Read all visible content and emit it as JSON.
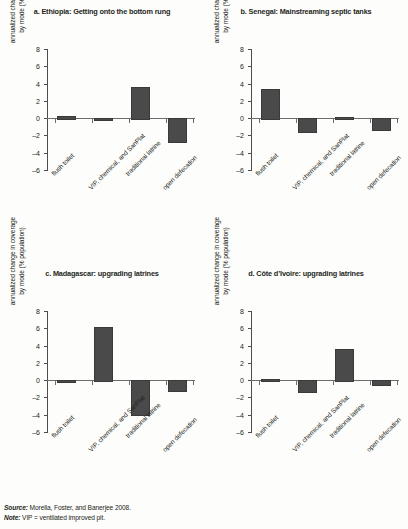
{
  "figure": {
    "ylabel_line1": "annualized change in coverage",
    "ylabel_line2": "by mode (% population)",
    "source_lead": "Source:",
    "source_text": " Morella, Foster, and Banerjee 2008.",
    "note_lead": "Note:",
    "note_text": " VIP = ventilated improved pit.",
    "bar_color": "#4a4a4a",
    "axis_color": "#4d4d4d"
  },
  "chart_data": [
    {
      "type": "bar",
      "title": "a. Ethiopia: Getting onto the bottom rung",
      "categories": [
        "flush toilet",
        "VIP, chemical, and SanPlat",
        "traditional latrine",
        "open defecation"
      ],
      "values": [
        0.3,
        -0.15,
        3.6,
        -2.7
      ],
      "xlabel": "",
      "ylabel": "annualized change in coverage by mode (% population)",
      "ylim": [
        -6,
        8
      ],
      "yticks": [
        8,
        6,
        4,
        2,
        0,
        -2,
        -4,
        -6
      ],
      "grid": false,
      "legend": "none"
    },
    {
      "type": "bar",
      "title": "b. Senegal: Mainstreaming septic tanks",
      "categories": [
        "flush toilet",
        "VIP, chemical, and SanPlat",
        "traditional latrine",
        "open defecation"
      ],
      "values": [
        3.4,
        -1.5,
        0.0,
        -1.2
      ],
      "xlabel": "",
      "ylabel": "annualized change in coverage by mode (% population)",
      "ylim": [
        -6,
        8
      ],
      "yticks": [
        8,
        6,
        4,
        2,
        0,
        -2,
        -4,
        -6
      ],
      "grid": false,
      "legend": "none"
    },
    {
      "type": "bar",
      "title": "c. Madagascar: upgrading latrines",
      "categories": [
        "flush toilet",
        "VIP, chemical, and SanPlat",
        "traditional latrine",
        "open defecation"
      ],
      "values": [
        -0.15,
        6.1,
        -3.9,
        -1.1
      ],
      "xlabel": "",
      "ylabel": "annualized change in coverage by mode (% population)",
      "ylim": [
        -6,
        8
      ],
      "yticks": [
        8,
        6,
        4,
        2,
        0,
        -2,
        -4,
        -6
      ],
      "grid": false,
      "legend": "none"
    },
    {
      "type": "bar",
      "title": "d. Côte d’Ivoire: upgrading latrines",
      "categories": [
        "flush toilet",
        "VIP, chemical, and SanPlat",
        "traditional latrine",
        "open defecation"
      ],
      "values": [
        0.15,
        -1.3,
        3.6,
        -0.45
      ],
      "xlabel": "",
      "ylabel": "annualized change in coverage by mode (% population)",
      "ylim": [
        -6,
        8
      ],
      "yticks": [
        8,
        6,
        4,
        2,
        0,
        -2,
        -4,
        -6
      ],
      "grid": false,
      "legend": "none"
    }
  ]
}
